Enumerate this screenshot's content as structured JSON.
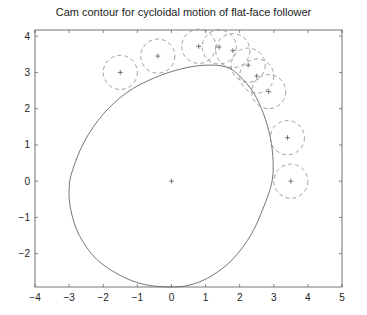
{
  "chart_data": {
    "type": "line",
    "title": "Cam contour for cycloidal motion of flat-face follower",
    "xlabel": "",
    "ylabel": "",
    "xlim": [
      -4,
      5
    ],
    "ylim": [
      -2.92,
      4.17
    ],
    "xticks": [
      -4,
      -3,
      -2,
      -1,
      0,
      1,
      2,
      3,
      4,
      5
    ],
    "yticks": [
      -2,
      -1,
      0,
      1,
      2,
      3,
      4
    ],
    "grid": false,
    "legend": null,
    "colors": {
      "axes": "#555555",
      "cam": "#666666",
      "circles": "#888888"
    },
    "center_marker": [
      0,
      0
    ],
    "series": [
      {
        "name": "cam-contour",
        "style": "solid",
        "points": [
          [
            0,
            -2.92
          ],
          [
            0.6,
            -2.85
          ],
          [
            1.2,
            -2.6
          ],
          [
            1.8,
            -2.15
          ],
          [
            2.35,
            -1.45
          ],
          [
            2.75,
            -0.6
          ],
          [
            2.95,
            0
          ],
          [
            2.98,
            0.55
          ],
          [
            2.9,
            1.2
          ],
          [
            2.7,
            1.85
          ],
          [
            2.4,
            2.45
          ],
          [
            2.0,
            2.9
          ],
          [
            1.6,
            3.15
          ],
          [
            1.0,
            3.2
          ],
          [
            0.3,
            3.1
          ],
          [
            -0.5,
            2.85
          ],
          [
            -1.3,
            2.45
          ],
          [
            -2.0,
            1.85
          ],
          [
            -2.55,
            1.1
          ],
          [
            -2.9,
            0.3
          ],
          [
            -3.0,
            -0.2
          ],
          [
            -2.95,
            -0.8
          ],
          [
            -2.7,
            -1.5
          ],
          [
            -2.2,
            -2.15
          ],
          [
            -1.5,
            -2.6
          ],
          [
            -0.8,
            -2.85
          ],
          [
            0,
            -2.92
          ]
        ]
      },
      {
        "name": "follower-circles",
        "style": "dashed",
        "radius": 0.5,
        "centers": [
          [
            -1.5,
            3.0
          ],
          [
            -0.4,
            3.45
          ],
          [
            0.8,
            3.72
          ],
          [
            1.4,
            3.7
          ],
          [
            1.8,
            3.6
          ],
          [
            2.25,
            3.2
          ],
          [
            2.5,
            2.9
          ],
          [
            2.85,
            2.47
          ],
          [
            3.4,
            1.2
          ],
          [
            3.5,
            0
          ]
        ]
      }
    ]
  }
}
